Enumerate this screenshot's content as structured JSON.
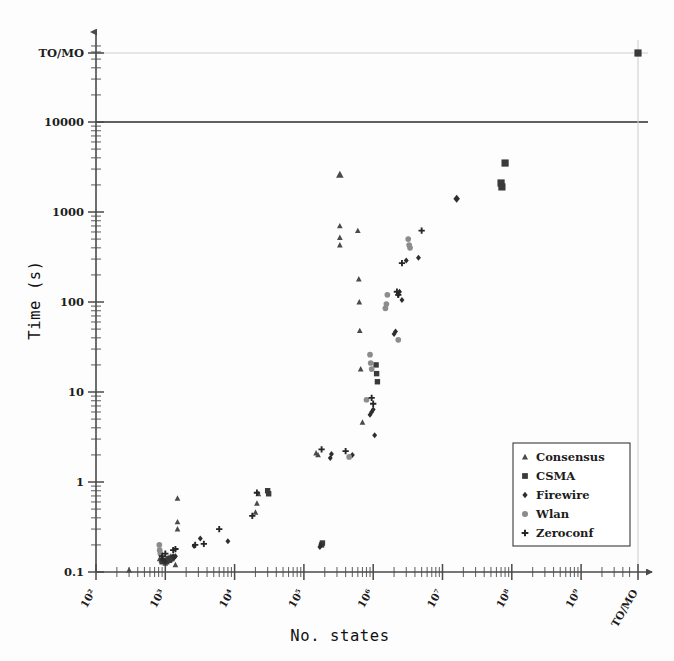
{
  "chart_data": {
    "type": "scatter",
    "title": "",
    "xlabel": "No.  states",
    "ylabel": "Time (s)",
    "xscale": "log",
    "yscale": "log",
    "xlim": [
      100,
      1000000000
    ],
    "ylim": [
      0.1,
      10000
    ],
    "grid": false,
    "legend_position": "lower-right",
    "x_tick_labels": [
      "10²",
      "10³",
      "10⁴",
      "10⁵",
      "10⁶",
      "10⁷",
      "10⁸",
      "10⁹",
      "TO/MO"
    ],
    "y_tick_labels": [
      "0.1",
      "1",
      "10",
      "100",
      "1000",
      "10000",
      "TO/MO"
    ],
    "reference_lines": [
      {
        "name": "timeout-line",
        "y_label": "10000",
        "style": "solid-dark"
      },
      {
        "name": "to-mo-line",
        "y_label": "TO/MO",
        "style": "solid-light"
      }
    ],
    "series": [
      {
        "name": "Consensus",
        "marker": "triangle",
        "color": "#4a4a4a",
        "points": [
          [
            300,
            0.105
          ],
          [
            1400,
            0.12
          ],
          [
            1500,
            0.66
          ],
          [
            1500,
            0.36
          ],
          [
            1500,
            0.3
          ],
          [
            830,
            0.14
          ],
          [
            880,
            0.135
          ],
          [
            950,
            0.13
          ],
          [
            1000,
            0.125
          ],
          [
            1100,
            0.145
          ],
          [
            1200,
            0.15
          ],
          [
            1250,
            0.14
          ],
          [
            20000,
            0.46
          ],
          [
            21000,
            0.58
          ],
          [
            22000,
            0.74
          ],
          [
            150000,
            2.1
          ],
          [
            160000,
            2.0
          ],
          [
            330000,
            2600
          ],
          [
            330000,
            700
          ],
          [
            330000,
            520
          ],
          [
            330000,
            430
          ],
          [
            600000,
            620
          ],
          [
            620000,
            180
          ],
          [
            630000,
            100
          ],
          [
            640000,
            48
          ],
          [
            660000,
            18
          ],
          [
            700000,
            4.6
          ]
        ]
      },
      {
        "name": "CSMA",
        "marker": "square",
        "color": "#3a3a3a",
        "points": [
          [
            900,
            0.13
          ],
          [
            1000,
            0.135
          ],
          [
            1050,
            0.13
          ],
          [
            1100,
            0.14
          ],
          [
            1150,
            0.135
          ],
          [
            1200,
            0.14
          ],
          [
            1250,
            0.145
          ],
          [
            30000,
            0.8
          ],
          [
            31000,
            0.74
          ],
          [
            180000,
            0.2
          ],
          [
            185000,
            0.21
          ],
          [
            1100000,
            20
          ],
          [
            1120000,
            16
          ],
          [
            1150000,
            13
          ],
          [
            80000000,
            3500
          ],
          [
            70000000,
            2100
          ],
          [
            72000000,
            1900
          ],
          [
            1000000000,
            12000
          ]
        ]
      },
      {
        "name": "Firewire",
        "marker": "diamond",
        "color": "#2e2e2e",
        "points": [
          [
            900,
            0.14
          ],
          [
            950,
            0.135
          ],
          [
            1000,
            0.13
          ],
          [
            1300,
            0.15
          ],
          [
            1350,
            0.145
          ],
          [
            1400,
            0.15
          ],
          [
            2600,
            0.195
          ],
          [
            3200,
            0.235
          ],
          [
            8000,
            0.22
          ],
          [
            170000,
            0.19
          ],
          [
            175000,
            0.2
          ],
          [
            240000,
            1.85
          ],
          [
            250000,
            2.05
          ],
          [
            500000,
            2.0
          ],
          [
            900000,
            5.6
          ],
          [
            950000,
            6.0
          ],
          [
            1000000,
            6.4
          ],
          [
            1050000,
            3.3
          ],
          [
            2000000,
            44
          ],
          [
            2100000,
            47
          ],
          [
            2300000,
            120
          ],
          [
            2400000,
            130
          ],
          [
            2600000,
            105
          ],
          [
            3000000,
            290
          ],
          [
            4500000,
            310
          ],
          [
            16000000,
            1400
          ]
        ]
      },
      {
        "name": "Wlan",
        "marker": "circle",
        "color": "#8c8c8c",
        "points": [
          [
            820,
            0.2
          ],
          [
            830,
            0.175
          ],
          [
            850,
            0.16
          ],
          [
            1500000,
            85
          ],
          [
            1550000,
            95
          ],
          [
            1600000,
            120
          ],
          [
            900000,
            26
          ],
          [
            920000,
            21
          ],
          [
            950000,
            18
          ],
          [
            800000,
            8.2
          ],
          [
            3200000,
            500
          ],
          [
            3300000,
            430
          ],
          [
            3400000,
            400
          ],
          [
            2300000,
            38
          ],
          [
            450000,
            1.9
          ]
        ]
      },
      {
        "name": "Zeroconf",
        "marker": "plus",
        "color": "#262626",
        "points": [
          [
            900,
            0.15
          ],
          [
            1000,
            0.16
          ],
          [
            1300,
            0.175
          ],
          [
            1400,
            0.18
          ],
          [
            2700,
            0.2
          ],
          [
            3600,
            0.205
          ],
          [
            6000,
            0.3
          ],
          [
            18000,
            0.42
          ],
          [
            21000,
            0.76
          ],
          [
            180000,
            2.3
          ],
          [
            400000,
            2.2
          ],
          [
            950000,
            8.6
          ],
          [
            1000000,
            7.4
          ],
          [
            2200000,
            130
          ],
          [
            2300000,
            120
          ],
          [
            2600000,
            270
          ],
          [
            5000000,
            620
          ]
        ]
      }
    ]
  },
  "axes": {
    "y_axis_name": "time-axis",
    "x_axis_name": "states-axis"
  },
  "legend": {
    "entries": [
      {
        "label": "Consensus",
        "marker": "triangle"
      },
      {
        "label": "CSMA",
        "marker": "square"
      },
      {
        "label": "Firewire",
        "marker": "diamond"
      },
      {
        "label": "Wlan",
        "marker": "circle"
      },
      {
        "label": "Zeroconf",
        "marker": "plus"
      }
    ]
  }
}
